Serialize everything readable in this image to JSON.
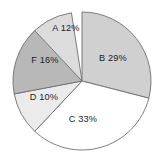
{
  "chart_data": {
    "type": "pie",
    "title": "",
    "subtitle": "",
    "xlabel": "",
    "ylabel": "",
    "grid": false,
    "legend_position": "none",
    "labels_inside_slices": true,
    "start_angle_deg": 0,
    "direction": "clockwise",
    "categories": [
      "A",
      "B",
      "C",
      "D",
      "F"
    ],
    "values": [
      12,
      29,
      33,
      10,
      16
    ],
    "units": "percent",
    "total": 100,
    "slices": [
      {
        "key": "A",
        "category": "A",
        "value": 12,
        "label": "A 12%",
        "color": "#dcdcdc",
        "start_deg": 308,
        "end_deg": 351.2,
        "label_x": 66,
        "label_y": 29
      },
      {
        "key": "B",
        "category": "B",
        "value": 29,
        "label": "B 29%",
        "color": "#d0d0d0",
        "start_deg": 0,
        "end_deg": 104.4,
        "label_x": 113,
        "label_y": 59
      },
      {
        "key": "C",
        "category": "C",
        "value": 33,
        "label": "C 33%",
        "color": "#ffffff",
        "start_deg": 104.4,
        "end_deg": 223.2,
        "label_x": 83,
        "label_y": 120
      },
      {
        "key": "D",
        "category": "D",
        "value": 10,
        "label": "D 10%",
        "color": "#ebebeb",
        "start_deg": 223.2,
        "end_deg": 259.2,
        "label_x": 44,
        "label_y": 98
      },
      {
        "key": "F",
        "category": "F",
        "value": 16,
        "label": "F 16%",
        "color": "#b8b8b8",
        "start_deg": 259.2,
        "end_deg": 316.8,
        "label_x": 45,
        "label_y": 61
      }
    ],
    "geometry": {
      "center_x": 82,
      "center_y": 81,
      "radius": 69
    },
    "style": {
      "background": "#ffffff",
      "stroke": "#6e6e6e",
      "label_color": "#1d1d1d"
    }
  }
}
